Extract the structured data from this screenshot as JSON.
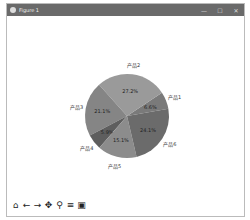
{
  "window": {
    "title": "Figure 1",
    "controls": [
      "—",
      "☐",
      "✕"
    ]
  },
  "toolbar": {
    "icons": [
      "home-icon",
      "back-icon",
      "forward-icon",
      "pan-icon",
      "zoom-icon",
      "configure-icon",
      "save-icon"
    ],
    "glyphs": [
      "⌂",
      "←",
      "→",
      "✥",
      "🔍",
      "≡",
      "▣"
    ]
  },
  "chart_data": {
    "type": "pie",
    "title": "",
    "categories": [
      "产品1",
      "产品2",
      "产品3",
      "产品4",
      "产品5",
      "产品6"
    ],
    "values": [
      6.6,
      27.2,
      21.1,
      5.9,
      15.1,
      24.1
    ],
    "labels_pct": [
      "6.6%",
      "27.2%",
      "21.1%",
      "5.9%",
      "15.1%",
      "24.1%"
    ],
    "colors": [
      "#7a7a7a",
      "#9a9a9a",
      "#858585",
      "#5e5e5e",
      "#8c8c8c",
      "#6b6b6b"
    ]
  }
}
